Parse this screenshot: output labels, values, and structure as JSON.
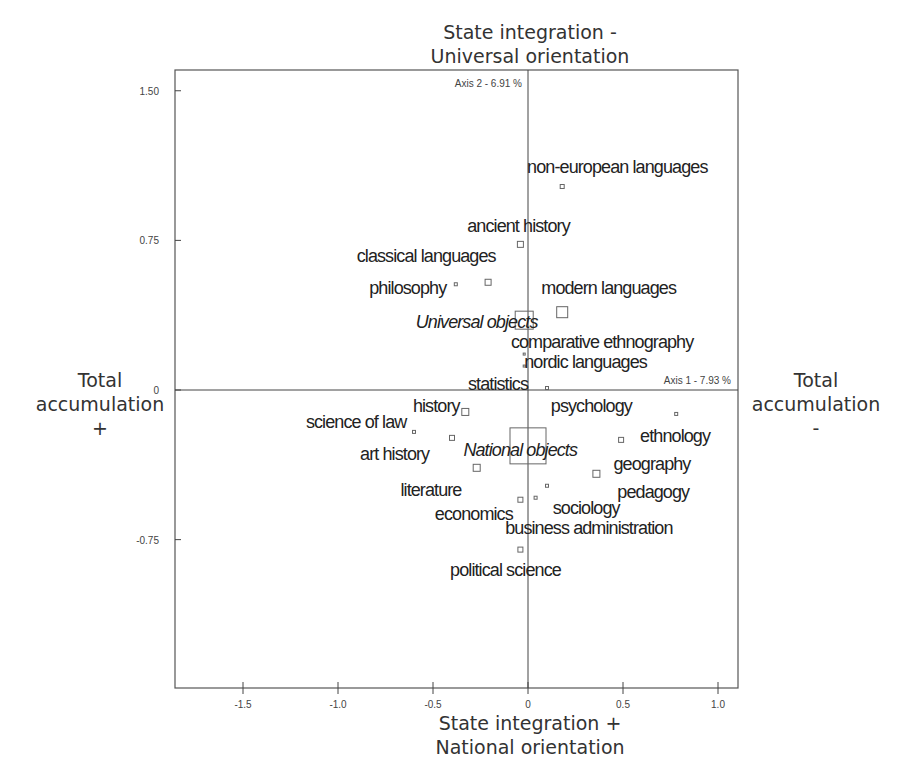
{
  "poles": {
    "top": [
      "State integration -",
      "Universal orientation"
    ],
    "bottom": [
      "State integration +",
      "National orientation"
    ],
    "left": [
      "Total",
      "accumulation",
      "+"
    ],
    "right": [
      "Total",
      "accumulation",
      "-"
    ]
  },
  "axis_labels": {
    "axis1": "Axis 1  -  7.93 %",
    "axis2": "Axis 2  -  6.91 %"
  },
  "colors": {
    "frame": "#555555",
    "marker": "#666666",
    "text": "#222222"
  },
  "chart_data": {
    "type": "scatter",
    "title": "",
    "xlabel": "State integration + / National orientation",
    "ylabel": "",
    "x_axis_caption": "Axis 1 - 7.93 %",
    "y_axis_caption": "Axis 2 - 6.91 %",
    "xlim": [
      -1.82,
      1.11
    ],
    "ylim": [
      -1.49,
      1.61
    ],
    "x_ticks": [
      -1.5,
      -1.0,
      -0.5,
      0,
      0.5,
      1.0
    ],
    "x_tick_labels": [
      "-1.5",
      "-1.0",
      "-0.5",
      "0",
      "0.5",
      "1.0"
    ],
    "y_ticks": [
      1.5,
      0.75,
      0,
      -0.75
    ],
    "y_tick_labels": [
      "1.50",
      "0.75",
      "0",
      "-0.75"
    ],
    "grid": false,
    "legend": "none",
    "points": [
      {
        "label": "non-european languages",
        "x": 0.18,
        "y": 1.02,
        "size": 4,
        "italic": false,
        "lx": 0.47,
        "ly": 1.09,
        "anchor": "middle"
      },
      {
        "label": "ancient history",
        "x": -0.04,
        "y": 0.73,
        "size": 6,
        "italic": false,
        "lx": -0.05,
        "ly": 0.79,
        "anchor": "middle"
      },
      {
        "label": "classical languages",
        "x": -0.21,
        "y": 0.54,
        "size": 6,
        "italic": false,
        "lx": -0.17,
        "ly": 0.64,
        "anchor": "end"
      },
      {
        "label": "philosophy",
        "x": -0.38,
        "y": 0.53,
        "size": 3,
        "italic": false,
        "lx": -0.43,
        "ly": 0.48,
        "anchor": "end"
      },
      {
        "label": "modern languages",
        "x": 0.18,
        "y": 0.39,
        "size": 11,
        "italic": false,
        "lx": 0.07,
        "ly": 0.48,
        "anchor": "start"
      },
      {
        "label": "Universal objects",
        "x": -0.02,
        "y": 0.35,
        "size": 18,
        "italic": true,
        "lx": 0.05,
        "ly": 0.31,
        "anchor": "end"
      },
      {
        "label": "comparative ethnography",
        "x": -0.02,
        "y": 0.18,
        "size": 2,
        "italic": false,
        "lx": -0.09,
        "ly": 0.21,
        "anchor": "start"
      },
      {
        "label": "nordic languages",
        "x": -0.02,
        "y": 0.12,
        "size": 2,
        "italic": false,
        "lx": -0.02,
        "ly": 0.11,
        "anchor": "start"
      },
      {
        "label": "statistics",
        "x": 0.1,
        "y": 0.01,
        "size": 3,
        "italic": false,
        "lx": 0.0,
        "ly": -0.001,
        "anchor": "end"
      },
      {
        "label": "history",
        "x": -0.33,
        "y": -0.11,
        "size": 7,
        "italic": false,
        "lx": -0.36,
        "ly": -0.11,
        "anchor": "end"
      },
      {
        "label": "psychology",
        "x": 0.78,
        "y": -0.12,
        "size": 3,
        "italic": false,
        "lx": 0.12,
        "ly": -0.11,
        "anchor": "start"
      },
      {
        "label": "science of law",
        "x": -0.6,
        "y": -0.21,
        "size": 3,
        "italic": false,
        "lx": -0.64,
        "ly": -0.19,
        "anchor": "end"
      },
      {
        "label": "art history",
        "x": -0.4,
        "y": -0.24,
        "size": 5,
        "italic": false,
        "lx": -0.52,
        "ly": -0.35,
        "anchor": "end"
      },
      {
        "label": "ethnology",
        "x": 0.49,
        "y": -0.25,
        "size": 5,
        "italic": false,
        "lx": 0.59,
        "ly": -0.26,
        "anchor": "start"
      },
      {
        "label": "National objects",
        "x": 0.0,
        "y": -0.28,
        "size": 36,
        "italic": true,
        "lx": -0.34,
        "ly": -0.33,
        "anchor": "start"
      },
      {
        "label": "geography",
        "x": 0.36,
        "y": -0.42,
        "size": 7,
        "italic": false,
        "lx": 0.45,
        "ly": -0.4,
        "anchor": "start"
      },
      {
        "label": "literature",
        "x": -0.27,
        "y": -0.39,
        "size": 7,
        "italic": false,
        "lx": -0.35,
        "ly": -0.53,
        "anchor": "end"
      },
      {
        "label": "pedagogy",
        "x": 0.1,
        "y": -0.48,
        "size": 3,
        "italic": false,
        "lx": 0.47,
        "ly": -0.54,
        "anchor": "start"
      },
      {
        "label": "economics",
        "x": -0.04,
        "y": -0.55,
        "size": 5,
        "italic": false,
        "lx": -0.08,
        "ly": -0.65,
        "anchor": "end"
      },
      {
        "label": "sociology",
        "x": 0.04,
        "y": -0.54,
        "size": 3,
        "italic": false,
        "lx": 0.13,
        "ly": -0.62,
        "anchor": "start"
      },
      {
        "label": "business administration",
        "x": 0.04,
        "y": -0.54,
        "size": 0,
        "italic": false,
        "lx": -0.12,
        "ly": -0.72,
        "anchor": "start"
      },
      {
        "label": "political science",
        "x": -0.04,
        "y": -0.8,
        "size": 5,
        "italic": false,
        "lx": -0.41,
        "ly": -0.93,
        "anchor": "start"
      }
    ]
  }
}
